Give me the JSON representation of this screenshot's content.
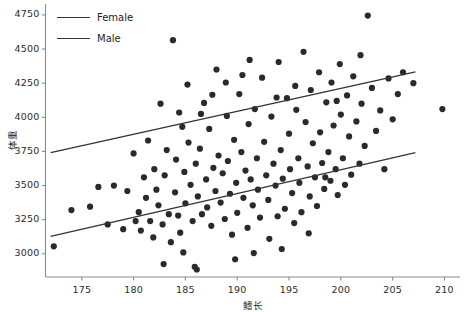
{
  "chart_data": {
    "type": "scatter",
    "title": "",
    "subtitle": "",
    "xlabel": "鳍长",
    "ylabel": "体重",
    "xlim": [
      171.5,
      211.5
    ],
    "ylim": [
      2830,
      4830
    ],
    "xticks": [
      175,
      180,
      185,
      190,
      195,
      200,
      205,
      210
    ],
    "yticks": [
      3000,
      3250,
      3500,
      3750,
      4000,
      4250,
      4500,
      4750
    ],
    "xtick_labels": [
      "175",
      "180",
      "185",
      "190",
      "195",
      "200",
      "205",
      "210"
    ],
    "ytick_labels": [
      "3000",
      "3250",
      "3500",
      "3750",
      "4000",
      "4250",
      "4500",
      "4750"
    ],
    "grid": false,
    "legend_position": "top-left-inside",
    "point_color": "#2a2a2a",
    "point_radius": 3.1,
    "line_color": "#333333",
    "axis_color": "#8a8a8a",
    "legend": [
      {
        "name": "Female",
        "label": "Female",
        "color": "#333333"
      },
      {
        "name": "Male",
        "label": "Male",
        "color": "#333333"
      }
    ],
    "trendlines": [
      {
        "name": "Female",
        "x": [
          172.0,
          207.2
        ],
        "y": [
          3742,
          4332
        ],
        "color": "#333333"
      },
      {
        "name": "Male",
        "x": [
          172.0,
          207.2
        ],
        "y": [
          3128,
          3742
        ],
        "color": "#333333"
      }
    ],
    "points": [
      [
        172.3,
        3055
      ],
      [
        174.0,
        3320
      ],
      [
        176.6,
        3490
      ],
      [
        178.1,
        3500
      ],
      [
        179.0,
        3180
      ],
      [
        179.4,
        3460
      ],
      [
        180.0,
        3735
      ],
      [
        180.2,
        3240
      ],
      [
        180.5,
        3305
      ],
      [
        180.7,
        3170
      ],
      [
        181.0,
        3560
      ],
      [
        181.2,
        3410
      ],
      [
        181.4,
        3830
      ],
      [
        181.6,
        3240
      ],
      [
        181.9,
        3120
      ],
      [
        182.0,
        3620
      ],
      [
        182.2,
        3470
      ],
      [
        182.4,
        3355
      ],
      [
        182.6,
        4100
      ],
      [
        182.8,
        3215
      ],
      [
        183.0,
        3575
      ],
      [
        183.2,
        3760
      ],
      [
        183.4,
        3290
      ],
      [
        183.6,
        3085
      ],
      [
        183.8,
        4565
      ],
      [
        184.0,
        3450
      ],
      [
        184.1,
        3690
      ],
      [
        184.3,
        3280
      ],
      [
        184.5,
        3155
      ],
      [
        184.7,
        3930
      ],
      [
        184.9,
        3600
      ],
      [
        185.0,
        3370
      ],
      [
        185.2,
        4240
      ],
      [
        185.3,
        3815
      ],
      [
        185.5,
        3505
      ],
      [
        185.7,
        3240
      ],
      [
        185.9,
        2905
      ],
      [
        186.0,
        3660
      ],
      [
        186.2,
        3420
      ],
      [
        186.4,
        3770
      ],
      [
        186.6,
        3290
      ],
      [
        186.8,
        4105
      ],
      [
        187.0,
        3545
      ],
      [
        187.1,
        3340
      ],
      [
        187.3,
        3915
      ],
      [
        187.5,
        3205
      ],
      [
        187.7,
        3630
      ],
      [
        187.9,
        3460
      ],
      [
        188.0,
        4350
      ],
      [
        188.2,
        3720
      ],
      [
        188.4,
        3375
      ],
      [
        188.6,
        3590
      ],
      [
        188.8,
        3255
      ],
      [
        189.0,
        4010
      ],
      [
        189.1,
        3680
      ],
      [
        189.3,
        3440
      ],
      [
        189.5,
        3140
      ],
      [
        189.7,
        3835
      ],
      [
        189.9,
        3520
      ],
      [
        190.0,
        3300
      ],
      [
        190.2,
        4170
      ],
      [
        190.4,
        3745
      ],
      [
        190.6,
        3410
      ],
      [
        190.8,
        3610
      ],
      [
        191.0,
        3190
      ],
      [
        191.1,
        3950
      ],
      [
        191.3,
        3545
      ],
      [
        191.5,
        3355
      ],
      [
        191.7,
        4060
      ],
      [
        191.9,
        3700
      ],
      [
        192.0,
        3470
      ],
      [
        192.2,
        3265
      ],
      [
        192.4,
        4290
      ],
      [
        192.6,
        3820
      ],
      [
        192.8,
        3575
      ],
      [
        193.0,
        3395
      ],
      [
        193.1,
        3110
      ],
      [
        193.3,
        4005
      ],
      [
        193.5,
        3660
      ],
      [
        193.7,
        3500
      ],
      [
        193.9,
        3275
      ],
      [
        194.0,
        4405
      ],
      [
        194.2,
        3760
      ],
      [
        194.4,
        3550
      ],
      [
        194.6,
        3330
      ],
      [
        194.8,
        4140
      ],
      [
        195.0,
        3880
      ],
      [
        195.1,
        3620
      ],
      [
        195.3,
        3445
      ],
      [
        195.5,
        3225
      ],
      [
        195.7,
        4055
      ],
      [
        195.9,
        3700
      ],
      [
        196.0,
        3520
      ],
      [
        196.2,
        3305
      ],
      [
        196.4,
        4480
      ],
      [
        196.6,
        3965
      ],
      [
        196.8,
        3640
      ],
      [
        197.0,
        3420
      ],
      [
        197.1,
        4200
      ],
      [
        197.3,
        3810
      ],
      [
        197.5,
        3560
      ],
      [
        197.7,
        3350
      ],
      [
        197.9,
        4330
      ],
      [
        198.0,
        3890
      ],
      [
        198.2,
        3665
      ],
      [
        198.4,
        3475
      ],
      [
        198.6,
        4110
      ],
      [
        198.8,
        3745
      ],
      [
        199.0,
        3535
      ],
      [
        199.1,
        4255
      ],
      [
        199.3,
        3940
      ],
      [
        199.5,
        3620
      ],
      [
        199.7,
        3430
      ],
      [
        199.9,
        4390
      ],
      [
        200.0,
        4020
      ],
      [
        200.2,
        3700
      ],
      [
        200.4,
        3505
      ],
      [
        200.6,
        4160
      ],
      [
        200.8,
        3860
      ],
      [
        201.0,
        3580
      ],
      [
        201.2,
        4300
      ],
      [
        201.5,
        3970
      ],
      [
        201.8,
        3660
      ],
      [
        202.0,
        4100
      ],
      [
        202.3,
        3790
      ],
      [
        202.6,
        4745
      ],
      [
        203.0,
        4215
      ],
      [
        203.4,
        3900
      ],
      [
        203.8,
        4050
      ],
      [
        204.2,
        3620
      ],
      [
        204.6,
        4285
      ],
      [
        205.0,
        3985
      ],
      [
        205.5,
        4170
      ],
      [
        206.0,
        4330
      ],
      [
        207.0,
        4250
      ],
      [
        209.8,
        4060
      ],
      [
        186.5,
        4025
      ],
      [
        188.9,
        4255
      ],
      [
        190.5,
        4310
      ],
      [
        184.4,
        4035
      ],
      [
        193.8,
        4145
      ],
      [
        195.6,
        4230
      ],
      [
        191.2,
        4420
      ],
      [
        187.6,
        4165
      ],
      [
        199.6,
        4120
      ],
      [
        201.9,
        4455
      ],
      [
        177.5,
        3215
      ],
      [
        175.8,
        3345
      ],
      [
        182.9,
        2925
      ],
      [
        186.1,
        2885
      ],
      [
        189.8,
        2960
      ],
      [
        194.3,
        3035
      ],
      [
        196.9,
        3150
      ],
      [
        191.6,
        3005
      ],
      [
        184.8,
        3010
      ],
      [
        198.5,
        3560
      ]
    ]
  }
}
